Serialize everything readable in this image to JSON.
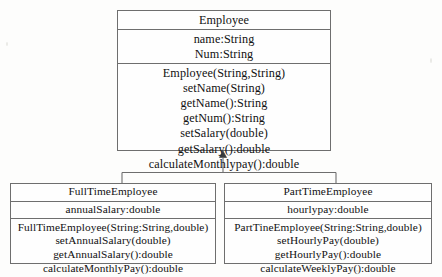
{
  "diagram": {
    "type": "uml-class-diagram",
    "relationship": "generalization",
    "classes": [
      {
        "id": "employee",
        "name": "Employee",
        "role": "superclass",
        "attributes": [
          "name:String",
          "Num:String"
        ],
        "operations": [
          "Employee(String,String)",
          "setName(String)",
          "getName():String",
          "getNum():String",
          "setSalary(double)",
          "getSalary():double",
          "calculateMonthlypay():double"
        ]
      },
      {
        "id": "fulltime",
        "name": "FullTimeEmployee",
        "role": "subclass",
        "attributes": [
          "annualSalary:double"
        ],
        "operations": [
          "FullTimeEmployee(String:String,double)",
          "setAnnualSalary(double)",
          "getAnnualSalary():double",
          "calculateMonthlyPay():double"
        ]
      },
      {
        "id": "parttime",
        "name": "PartTimeEmployee",
        "role": "subclass",
        "attributes": [
          "hourlypay:double"
        ],
        "operations": [
          "PartTineEmployee(String:String,double)",
          "setHourlyPay(double)",
          "getHourlyPay():double",
          "calculateWeeklyPay():double"
        ]
      }
    ],
    "colors": {
      "line": "#6e6e6e",
      "text": "#111111",
      "background": "#fdfdfc",
      "box_fill": "#fefefe"
    }
  }
}
